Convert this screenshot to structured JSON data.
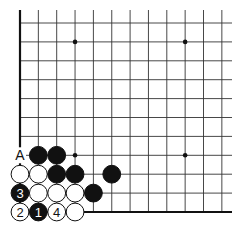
{
  "diagram": {
    "type": "go-board-corner",
    "corner": "bottom-left",
    "visible_columns": 12,
    "visible_rows": 11,
    "colors": {
      "line": "#333333",
      "black_stone": "#111111",
      "white_stone": "#ffffff",
      "background": "#ffffff"
    },
    "hoshi": [
      {
        "col": 3,
        "row": 3
      },
      {
        "col": 9,
        "row": 3
      },
      {
        "col": 3,
        "row": 9
      },
      {
        "col": 9,
        "row": 9
      }
    ],
    "stones": [
      {
        "col": 1,
        "row": 3,
        "color": "black",
        "label": ""
      },
      {
        "col": 2,
        "row": 3,
        "color": "black",
        "label": ""
      },
      {
        "col": 0,
        "row": 2,
        "color": "white",
        "label": ""
      },
      {
        "col": 1,
        "row": 2,
        "color": "white",
        "label": ""
      },
      {
        "col": 2,
        "row": 2,
        "color": "black",
        "label": ""
      },
      {
        "col": 3,
        "row": 2,
        "color": "black",
        "label": ""
      },
      {
        "col": 5,
        "row": 2,
        "color": "black",
        "label": ""
      },
      {
        "col": 0,
        "row": 1,
        "color": "black",
        "label": "3"
      },
      {
        "col": 1,
        "row": 1,
        "color": "white",
        "label": ""
      },
      {
        "col": 2,
        "row": 1,
        "color": "white",
        "label": ""
      },
      {
        "col": 3,
        "row": 1,
        "color": "white",
        "label": ""
      },
      {
        "col": 4,
        "row": 1,
        "color": "black",
        "label": ""
      },
      {
        "col": 0,
        "row": 0,
        "color": "white",
        "label": "2"
      },
      {
        "col": 1,
        "row": 0,
        "color": "black",
        "label": "1"
      },
      {
        "col": 2,
        "row": 0,
        "color": "white",
        "label": "4"
      },
      {
        "col": 3,
        "row": 0,
        "color": "white",
        "label": ""
      }
    ],
    "point_labels": [
      {
        "col": 0,
        "row": 3,
        "text": "A"
      }
    ]
  }
}
